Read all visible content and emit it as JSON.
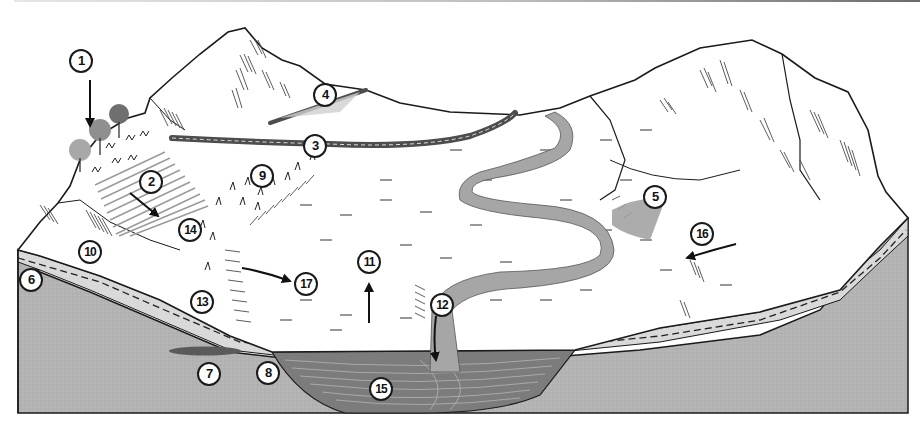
{
  "diagram": {
    "type": "watershed-cross-section",
    "colors": {
      "sky": "#ffffff",
      "land_surface": "#ffffff",
      "outline": "#1a1a1a",
      "hatch": "#4a4a4a",
      "soil_layer": "#d9d9d9",
      "bedrock": "#b3b3b3",
      "aquifer_lens": "#5a5a5a",
      "stream": "#a6a6a6",
      "road": "#4d4d4d",
      "road_dash": "#e0e0e0",
      "field_rows": "#9a9a9a",
      "trees": "#8c8c8c",
      "sediment_fan": "#9e9e9e",
      "water_table_dash": "#2b2b2b"
    },
    "callouts": [
      {
        "id": "1",
        "label": "1",
        "x": 80,
        "y": 50
      },
      {
        "id": "2",
        "label": "2",
        "x": 140,
        "y": 170
      },
      {
        "id": "3",
        "label": "3",
        "x": 303,
        "y": 134
      },
      {
        "id": "4",
        "label": "4",
        "x": 313,
        "y": 84
      },
      {
        "id": "5",
        "label": "5",
        "x": 643,
        "y": 186
      },
      {
        "id": "6",
        "label": "6",
        "x": 20,
        "y": 268
      },
      {
        "id": "7",
        "label": "7",
        "x": 198,
        "y": 362
      },
      {
        "id": "8",
        "label": "8",
        "x": 256,
        "y": 361
      },
      {
        "id": "9",
        "label": "9",
        "x": 250,
        "y": 165
      },
      {
        "id": "10",
        "label": "10",
        "x": 78,
        "y": 241
      },
      {
        "id": "11",
        "label": "11",
        "x": 357,
        "y": 250
      },
      {
        "id": "12",
        "label": "12",
        "x": 430,
        "y": 293
      },
      {
        "id": "13",
        "label": "13",
        "x": 190,
        "y": 290
      },
      {
        "id": "14",
        "label": "14",
        "x": 178,
        "y": 218
      },
      {
        "id": "15",
        "label": "15",
        "x": 370,
        "y": 378
      },
      {
        "id": "16",
        "label": "16",
        "x": 690,
        "y": 222
      },
      {
        "id": "17",
        "label": "17",
        "x": 295,
        "y": 272
      }
    ],
    "arrows": [
      {
        "name": "arrow-precipitation",
        "from": [
          90,
          80
        ],
        "to": [
          90,
          128
        ]
      },
      {
        "name": "arrow-field-runoff",
        "from": [
          130,
          193
        ],
        "to": [
          160,
          218
        ]
      },
      {
        "name": "arrow-overland-flow",
        "from": [
          242,
          268
        ],
        "to": [
          292,
          282
        ]
      },
      {
        "name": "arrow-evaporation",
        "from": [
          369,
          323
        ],
        "to": [
          369,
          282
        ]
      },
      {
        "name": "arrow-infiltration",
        "from": [
          436,
          316
        ],
        "to": [
          436,
          361
        ]
      },
      {
        "name": "arrow-hillslope-flow",
        "from": [
          736,
          244
        ],
        "to": [
          685,
          259
        ]
      }
    ]
  }
}
